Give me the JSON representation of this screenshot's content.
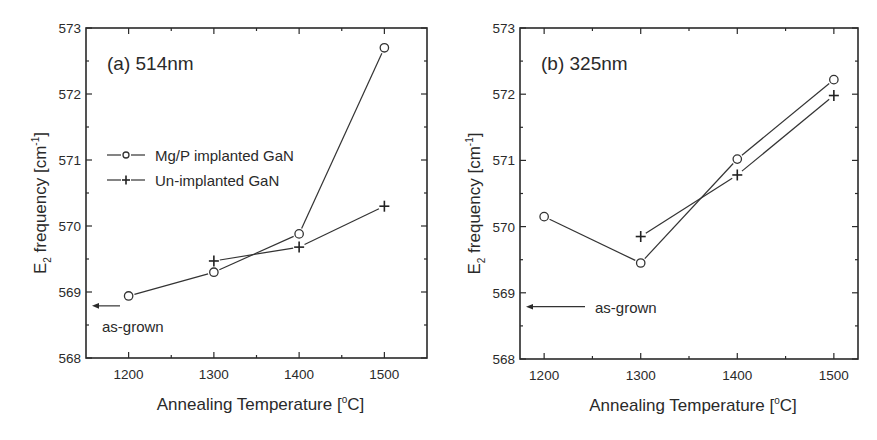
{
  "figure": {
    "width": 877,
    "height": 440,
    "colors": {
      "ink": "#2a2a2a",
      "line": "#333333",
      "background": "#ffffff"
    }
  },
  "chart_data": [
    {
      "type": "line",
      "panel_label": "(a) 514nm",
      "title": "(a) 514nm",
      "xlabel": "Annealing Temperature [°C]",
      "xlabel_parts": {
        "main": "Annealing Temperature [",
        "sup": "o",
        "tail": "C]"
      },
      "ylabel": "E2 frequency [cm-1]",
      "ylabel_parts": {
        "main": "E",
        "sub": "2",
        "mid": " frequency [cm",
        "sup": "-1",
        "tail": "]"
      },
      "xlim": [
        1150,
        1550
      ],
      "ylim": [
        568,
        573
      ],
      "xticks": [
        1200,
        1300,
        1400,
        1500
      ],
      "xticks_minor": [
        1250,
        1350,
        1450
      ],
      "yticks": [
        568,
        569,
        570,
        571,
        572,
        573
      ],
      "yticks_minor": [
        568.5,
        569.5,
        570.5,
        571.5,
        572.5
      ],
      "grid": false,
      "legend": {
        "position": "upper-left-middle",
        "entries": [
          {
            "label": "Mg/P implanted GaN",
            "marker": "circle"
          },
          {
            "label": "Un-implanted GaN",
            "marker": "plus"
          }
        ]
      },
      "series": [
        {
          "name": "Mg/P implanted GaN",
          "marker": "circle",
          "x": [
            1200,
            1300,
            1400,
            1500
          ],
          "values": [
            568.94,
            569.3,
            569.88,
            572.7
          ]
        },
        {
          "name": "Un-implanted GaN",
          "marker": "plus",
          "x": [
            1300,
            1400,
            1500
          ],
          "values": [
            569.47,
            569.68,
            570.3
          ]
        }
      ],
      "annotations": [
        {
          "text": "as-grown",
          "type": "arrow-to-axis",
          "y": 568.79
        }
      ],
      "box": {
        "x0": 86,
        "y0": 28,
        "x1": 427,
        "y1": 358
      }
    },
    {
      "type": "line",
      "panel_label": "(b) 325nm",
      "title": "(b) 325nm",
      "xlabel": "Annealing Temperature [°C]",
      "xlabel_parts": {
        "main": "Annealing Temperature [",
        "sup": "o",
        "tail": "C]"
      },
      "ylabel": "E2 frequency [cm-1]",
      "ylabel_parts": {
        "main": "E",
        "sub": "2",
        "mid": " frequency [cm",
        "sup": "-1",
        "tail": "]"
      },
      "xlim": [
        1175,
        1525
      ],
      "ylim": [
        568,
        573
      ],
      "xticks": [
        1200,
        1300,
        1400,
        1500
      ],
      "xticks_minor": [
        1250,
        1350,
        1450
      ],
      "yticks": [
        568,
        569,
        570,
        571,
        572,
        573
      ],
      "yticks_minor": [
        568.5,
        569.5,
        570.5,
        571.5,
        572.5
      ],
      "grid": false,
      "legend": null,
      "series": [
        {
          "name": "Mg/P implanted GaN",
          "marker": "circle",
          "x": [
            1200,
            1300,
            1400,
            1500
          ],
          "values": [
            570.15,
            569.45,
            571.02,
            572.22
          ]
        },
        {
          "name": "Un-implanted GaN",
          "marker": "plus",
          "x": [
            1300,
            1400,
            1500
          ],
          "values": [
            569.85,
            570.78,
            571.98
          ]
        }
      ],
      "annotations": [
        {
          "text": "as-grown",
          "type": "arrow-to-axis",
          "y": 568.79
        }
      ],
      "box": {
        "x0": 520,
        "y0": 28,
        "x1": 858,
        "y1": 359
      }
    }
  ]
}
